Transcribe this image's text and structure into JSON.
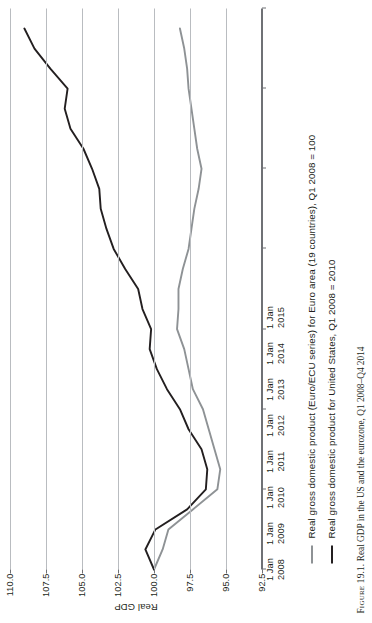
{
  "figure": {
    "caption_label": "Figure 19.1.",
    "caption_text": "Real GDP in the US and the eurozone, Q1 2008–Q4 2014"
  },
  "legend": {
    "position": "below-axis",
    "items": [
      {
        "name": "euro-area",
        "label": "Real gross domestic product (Euro/ECU series) for Euro area (19 countries), Q1 2008 = 100",
        "color": "#8e9295"
      },
      {
        "name": "united-states",
        "label": "Real gross domestic product for United States, Q1 2008 = 2010",
        "color": "#231f20"
      }
    ]
  },
  "chart_data": {
    "type": "line",
    "title": "",
    "xlabel": "",
    "ylabel": "Real GDP",
    "grid": true,
    "orientation": "rotated-90-ccw",
    "xlim": [
      "1 Jan 2008",
      "1 Jan 2015"
    ],
    "ylim": [
      92.5,
      110.0
    ],
    "ytick_labels": [
      "92.5",
      "95.0",
      "97.5",
      "100.0",
      "102.5",
      "105.0",
      "107.5",
      "110.0"
    ],
    "ytick_values": [
      92.5,
      95.0,
      97.5,
      100.0,
      102.5,
      105.0,
      107.5,
      110.0
    ],
    "xtick_labels": [
      "1 Jan\n2008",
      "1 Jan\n2009",
      "1 Jan\n2010",
      "1 Jan\n2011",
      "1 Jan\n2012",
      "1 Jan\n2013",
      "1 Jan\n2014",
      "1 Jan\n2015"
    ],
    "xtick_lines": [
      [
        "1 Jan",
        "2008"
      ],
      [
        "1 Jan",
        "2009"
      ],
      [
        "1 Jan",
        "2010"
      ],
      [
        "1 Jan",
        "2011"
      ],
      [
        "1 Jan",
        "2012"
      ],
      [
        "1 Jan",
        "2013"
      ],
      [
        "1 Jan",
        "2014"
      ],
      [
        "1 Jan",
        "2015"
      ]
    ],
    "x": [
      2008.0,
      2008.25,
      2008.5,
      2008.75,
      2009.0,
      2009.25,
      2009.5,
      2009.75,
      2010.0,
      2010.25,
      2010.5,
      2010.75,
      2011.0,
      2011.25,
      2011.5,
      2011.75,
      2012.0,
      2012.25,
      2012.5,
      2012.75,
      2013.0,
      2013.25,
      2013.5,
      2013.75,
      2014.0,
      2014.25,
      2014.5,
      2014.75
    ],
    "series": [
      {
        "name": "Euro area (19 countries)",
        "color": "#8e9295",
        "values": [
          100.0,
          99.4,
          99.0,
          97.3,
          95.6,
          95.4,
          95.8,
          96.2,
          96.6,
          97.3,
          97.6,
          97.9,
          98.4,
          98.3,
          98.3,
          98.0,
          97.6,
          97.4,
          97.2,
          96.9,
          96.7,
          97.0,
          97.2,
          97.4,
          97.6,
          97.7,
          97.9,
          98.2
        ]
      },
      {
        "name": "United States",
        "color": "#231f20",
        "values": [
          100.0,
          100.6,
          99.9,
          97.7,
          96.4,
          96.3,
          96.7,
          97.6,
          98.2,
          99.1,
          99.8,
          100.3,
          100.2,
          100.8,
          101.1,
          102.0,
          102.8,
          103.3,
          103.7,
          103.8,
          104.3,
          104.9,
          105.8,
          106.2,
          106.0,
          107.2,
          108.3,
          109.0
        ]
      }
    ]
  }
}
